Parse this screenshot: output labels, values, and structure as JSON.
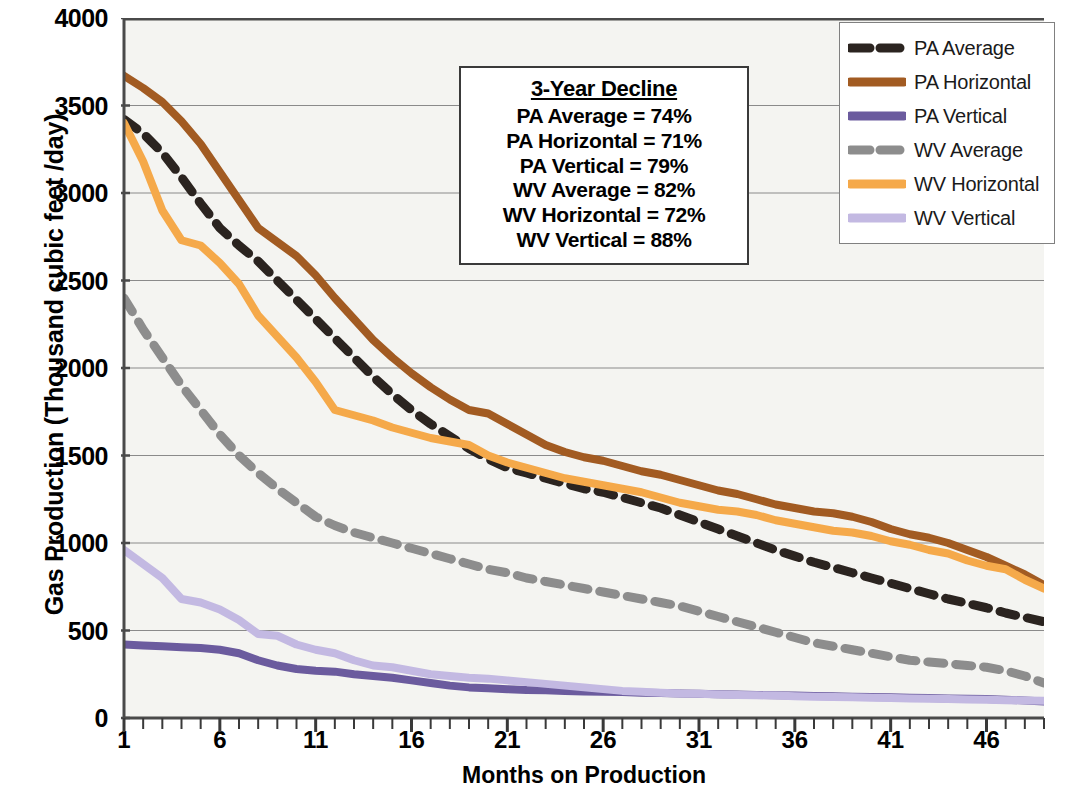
{
  "chart_data": {
    "type": "line",
    "title": "",
    "xlabel": "Months on Production",
    "ylabel": "Gas Production (Thousand cubic feet /day)",
    "xlim": [
      1,
      49
    ],
    "ylim": [
      0,
      4000
    ],
    "xticks": [
      1,
      6,
      11,
      16,
      21,
      26,
      31,
      36,
      41,
      46
    ],
    "yticks": [
      0,
      500,
      1000,
      1500,
      2000,
      2500,
      3000,
      3500,
      4000
    ],
    "minor_xtick_interval": 1,
    "grid": "horizontal",
    "legend_position": "top-right",
    "x": [
      1,
      2,
      3,
      4,
      5,
      6,
      7,
      8,
      9,
      10,
      11,
      12,
      13,
      14,
      15,
      16,
      17,
      18,
      19,
      20,
      21,
      22,
      23,
      24,
      25,
      26,
      27,
      28,
      29,
      30,
      31,
      32,
      33,
      34,
      35,
      36,
      37,
      38,
      39,
      40,
      41,
      42,
      43,
      44,
      45,
      46,
      47,
      48,
      49
    ],
    "series": [
      {
        "name": "PA Average",
        "color": "#2b2420",
        "style": "dashed",
        "values": [
          3420,
          3340,
          3230,
          3090,
          2940,
          2800,
          2700,
          2610,
          2500,
          2390,
          2280,
          2170,
          2060,
          1950,
          1850,
          1760,
          1680,
          1610,
          1540,
          1480,
          1430,
          1400,
          1370,
          1340,
          1310,
          1290,
          1260,
          1230,
          1200,
          1160,
          1120,
          1080,
          1040,
          1000,
          960,
          925,
          890,
          860,
          830,
          800,
          770,
          740,
          710,
          680,
          655,
          630,
          600,
          575,
          550
        ]
      },
      {
        "name": "PA Horizontal",
        "color": "#a25b22",
        "style": "solid",
        "values": [
          3670,
          3600,
          3520,
          3410,
          3280,
          3120,
          2960,
          2800,
          2720,
          2640,
          2530,
          2400,
          2280,
          2160,
          2060,
          1970,
          1890,
          1820,
          1760,
          1740,
          1680,
          1620,
          1560,
          1520,
          1490,
          1470,
          1440,
          1410,
          1390,
          1360,
          1330,
          1300,
          1280,
          1250,
          1220,
          1200,
          1180,
          1170,
          1150,
          1120,
          1080,
          1050,
          1030,
          1000,
          960,
          920,
          870,
          820,
          760
        ]
      },
      {
        "name": "PA Vertical",
        "color": "#6b5b9e",
        "style": "solid",
        "values": [
          420,
          415,
          410,
          405,
          400,
          390,
          370,
          330,
          300,
          280,
          270,
          265,
          250,
          240,
          230,
          215,
          200,
          185,
          175,
          170,
          165,
          160,
          158,
          155,
          152,
          150,
          148,
          145,
          143,
          140,
          138,
          136,
          134,
          132,
          130,
          128,
          126,
          124,
          122,
          120,
          118,
          116,
          114,
          112,
          110,
          108,
          105,
          100,
          95
        ]
      },
      {
        "name": "WV Average",
        "color": "#8d8d8d",
        "style": "dashed",
        "values": [
          2400,
          2220,
          2060,
          1900,
          1760,
          1620,
          1500,
          1400,
          1310,
          1230,
          1150,
          1100,
          1060,
          1030,
          1000,
          970,
          940,
          910,
          880,
          850,
          830,
          800,
          780,
          760,
          740,
          720,
          700,
          680,
          660,
          640,
          610,
          580,
          550,
          520,
          490,
          460,
          430,
          410,
          390,
          370,
          350,
          330,
          320,
          310,
          300,
          290,
          270,
          240,
          200
        ]
      },
      {
        "name": "WV Horizontal",
        "color": "#f5a94a",
        "style": "solid",
        "values": [
          3400,
          3180,
          2900,
          2730,
          2700,
          2600,
          2480,
          2300,
          2180,
          2060,
          1920,
          1760,
          1730,
          1700,
          1660,
          1630,
          1600,
          1580,
          1560,
          1500,
          1460,
          1430,
          1400,
          1370,
          1350,
          1330,
          1310,
          1290,
          1260,
          1230,
          1210,
          1190,
          1180,
          1160,
          1130,
          1110,
          1090,
          1070,
          1060,
          1040,
          1010,
          990,
          960,
          940,
          900,
          870,
          850,
          790,
          740
        ]
      },
      {
        "name": "WV Vertical",
        "color": "#c3b9e2",
        "style": "solid",
        "values": [
          960,
          880,
          800,
          680,
          660,
          620,
          560,
          480,
          470,
          420,
          390,
          370,
          330,
          300,
          290,
          270,
          250,
          240,
          230,
          225,
          215,
          205,
          195,
          185,
          175,
          165,
          155,
          150,
          145,
          140,
          138,
          135,
          132,
          130,
          128,
          125,
          122,
          120,
          118,
          116,
          114,
          112,
          110,
          108,
          106,
          104,
          102,
          100,
          98
        ]
      }
    ]
  },
  "annotation": {
    "heading": "3-Year Decline",
    "lines": [
      "PA Average = 74%",
      "PA Horizontal = 71%",
      "PA Vertical = 79%",
      "WV Average = 82%",
      "WV Horizontal = 72%",
      "WV Vertical = 88%"
    ]
  },
  "legend": {
    "items": [
      {
        "label": "PA Average"
      },
      {
        "label": "PA Horizontal"
      },
      {
        "label": "PA Vertical"
      },
      {
        "label": "WV Average"
      },
      {
        "label": "WV Horizontal"
      },
      {
        "label": "WV Vertical"
      }
    ]
  }
}
